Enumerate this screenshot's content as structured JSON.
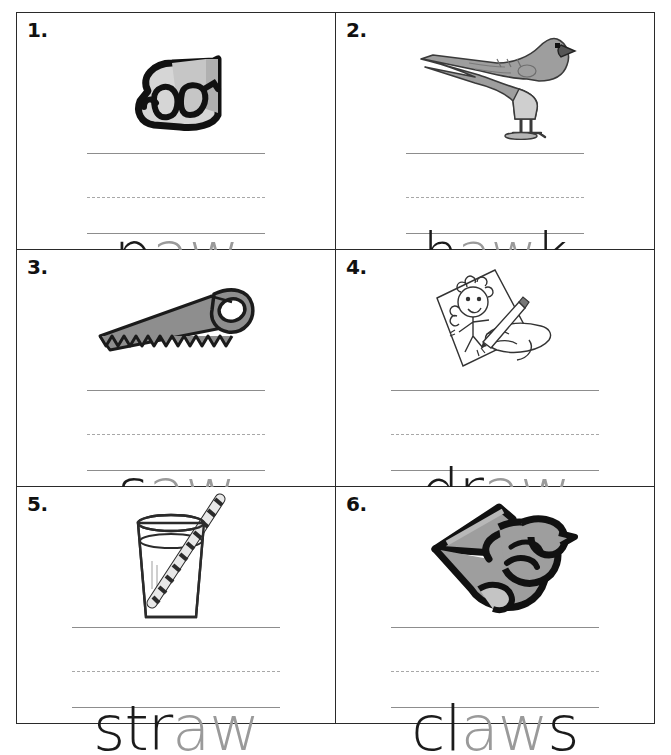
{
  "worksheet": {
    "title": "aw word picture worksheet",
    "columns": 2,
    "rows": 3,
    "line_style": "three-line handwriting guide: solid top, dashed middle, solid baseline",
    "colors": {
      "border": "#2a2a2a",
      "number": "#111111",
      "line_solid": "#8d8d8d",
      "line_dashed": "#a8a8a8",
      "letter_dark": "#1b1b1b",
      "letter_light": "#9a9a9a",
      "art_gray": "#9e9e9e",
      "art_gray_light": "#c9c9c9",
      "art_outline": "#111111"
    }
  },
  "items": [
    {
      "number": "1.",
      "word": "paw",
      "dark_prefix": "p",
      "light_part": "aw",
      "dark_suffix": "",
      "picture": "paw-illustration",
      "picture_label": "animal paw"
    },
    {
      "number": "2.",
      "word": "hawk",
      "dark_prefix": "h",
      "light_part": "aw",
      "dark_suffix": "k",
      "picture": "hawk-illustration",
      "picture_label": "hawk bird"
    },
    {
      "number": "3.",
      "word": "saw",
      "dark_prefix": "s",
      "light_part": "aw",
      "dark_suffix": "",
      "picture": "saw-illustration",
      "picture_label": "hand saw"
    },
    {
      "number": "4.",
      "word": "draw",
      "dark_prefix": "dr",
      "light_part": "aw",
      "dark_suffix": "",
      "picture": "draw-illustration",
      "picture_label": "hand drawing a picture with pencil"
    },
    {
      "number": "5.",
      "word": "straw",
      "dark_prefix": "str",
      "light_part": "aw",
      "dark_suffix": "",
      "picture": "straw-illustration",
      "picture_label": "glass of water with striped straw"
    },
    {
      "number": "6.",
      "word": "claws",
      "dark_prefix": "cl",
      "light_part": "aw",
      "dark_suffix": "s",
      "picture": "claws-illustration",
      "picture_label": "bird claws"
    }
  ]
}
